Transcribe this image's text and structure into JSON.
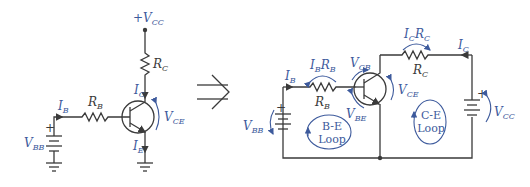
{
  "left_circuit": {
    "vcc_label": "+V",
    "vcc_sub": "CC",
    "rc_label": "R",
    "rc_sub": "C",
    "ic_label": "I",
    "ic_sub": "C",
    "vce_label": "V",
    "vce_sub": "CE",
    "ib_label": "I",
    "ib_sub": "B",
    "rb_label": "R",
    "rb_sub": "B",
    "vbb_label": "V",
    "vbb_sub": "BB",
    "ie_label": "I",
    "ie_sub": "E",
    "plus": "+"
  },
  "arrow": "⇒",
  "right_circuit": {
    "ib_label": "I",
    "ib_sub": "B",
    "ibrb_label1": "I",
    "ibrb_sub1": "B",
    "ibrb_label2": "R",
    "ibrb_sub2": "B",
    "rb_label": "R",
    "rb_sub": "B",
    "vcb_label": "V",
    "vcb_sub": "CB",
    "vbe_label": "V",
    "vbe_sub": "BE",
    "vbb_label": "V",
    "vbb_sub": "BB",
    "icrc_label1": "I",
    "icrc_sub1": "C",
    "icrc_label2": "R",
    "icrc_sub2": "C",
    "rc_label": "R",
    "rc_sub": "C",
    "ic_label": "I",
    "ic_sub": "C",
    "vce_label": "V",
    "vce_sub": "CE",
    "vcc_label": "V",
    "vcc_sub": "CC",
    "be_loop_line1": "B-E",
    "be_loop_line2": "Loop",
    "ce_loop_line1": "C-E",
    "ce_loop_line2": "Loop",
    "plus": "+"
  },
  "colors": {
    "wire": "#3a3a3a",
    "annotation": "#3d5a9c"
  }
}
